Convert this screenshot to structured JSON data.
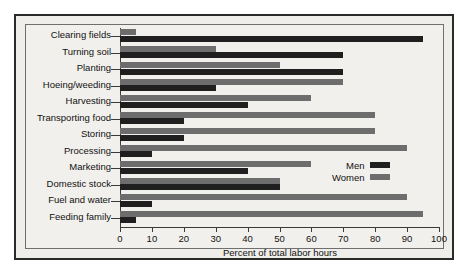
{
  "chart_data": {
    "type": "bar",
    "orientation": "horizontal",
    "title": "",
    "xlabel": "Percent of total labor hours",
    "ylabel": "",
    "xlim": [
      0,
      100
    ],
    "xticks": [
      0,
      10,
      20,
      30,
      40,
      50,
      60,
      70,
      80,
      90,
      100
    ],
    "grid": false,
    "legend_position": "middle-right",
    "categories": [
      "Clearing fields",
      "Turning soil",
      "Planting",
      "Hoeing/weeding",
      "Harvesting",
      "Transporting food",
      "Storing",
      "Processing",
      "Marketing",
      "Domestic stock",
      "Fuel and water",
      "Feeding family"
    ],
    "series": [
      {
        "name": "Men",
        "color": "#1f1f1f",
        "values": [
          95,
          70,
          70,
          30,
          40,
          20,
          20,
          10,
          40,
          50,
          10,
          5
        ]
      },
      {
        "name": "Women",
        "color": "#6d6d6d",
        "values": [
          5,
          30,
          50,
          70,
          60,
          80,
          80,
          90,
          60,
          50,
          90,
          95
        ]
      }
    ]
  },
  "legend": {
    "men_label": "Men",
    "women_label": "Women"
  }
}
